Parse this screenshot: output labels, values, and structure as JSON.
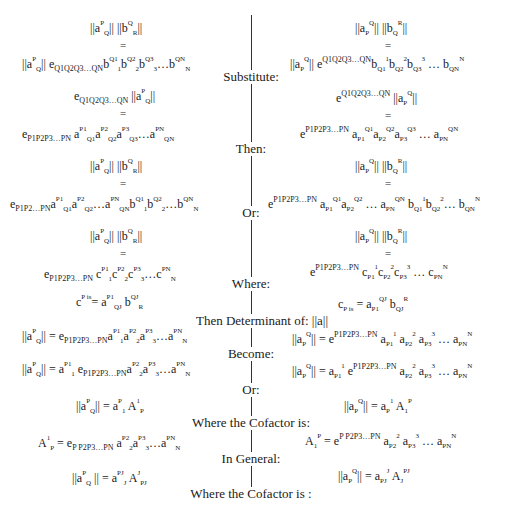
{
  "labels": {
    "substitute": "Substitute:",
    "then": "Then:",
    "or1": "Or:",
    "where": "Where:",
    "determinant": "Then Determinant of: ||a||",
    "become": "Become:",
    "or2": "Or:",
    "cofactor1": "Where the Cofactor is:",
    "general": "In General:",
    "cofactor2": "Where the Cofactor is :"
  },
  "left": {
    "eq1_lhs": "||aPQ|| ||bQR||",
    "eq1_rhs": "||aPQ|| eQ1Q2Q3...QN bQ1 1 bQ2 2 bQ3 3 ... bQN N",
    "eq2_lhs": "eQ1Q2Q3...QN ||aPQ||",
    "eq2_rhs": "eP1P2P3...PN aP1 Q1 aP2 Q2 aP3 Q3 ... aPN QN",
    "eq3_lhs": "||aPQ|| ||bQR||",
    "eq3_rhs": "eP1P2...PN aP1 Q1 aP2 Q2 ... aPN QN bQ1 1 bQ2 2 ... bQN N",
    "eq4_lhs": "||aPQ|| ||bQR||",
    "eq4_rhs": "eP1P2P3...PN cP1 1 cP2 2 cP3 3 ... cPN N",
    "eq5": "cP is = aP1 QJ bQJ R",
    "eq6": "||aPQ|| = eP1P2P3...PN aP1 1 aP2 2 aP3 3 ... aPN N",
    "eq7": "||aPQ|| = aP1 1 eP1P2P3...PN aP2 2 aP3 3 ... aPN N",
    "eq8": "||aPQ|| = aP1 A1P",
    "eq9": "A1P = eP P2P3...PN aP2 2 aP3 3 ... aPN N",
    "eq10": "||aPQ|| = aPJ J AJ PJ"
  },
  "right": {
    "eq1_lhs": "||aPQ|| ||bQR||",
    "eq1_rhs": "||aPQ|| eQ1Q2Q3...QN bQ1 1 bQ2 2 bQ3 3 ... bQN N",
    "eq2_lhs": "eQ1Q2Q3...QN ||aPQ||",
    "eq2_rhs": "eP1P2P3...PN aP1 Q1 aP2 Q2 aP3 Q3 ... aPN QN",
    "eq3_lhs": "||aPQ|| ||bQR||",
    "eq3_rhs": "eP1P2P3...PN aP1 Q1 aP2 Q2 ... aPN QN bQ1 1 bQ2 2 ... bQN N",
    "eq4_lhs": "||aPQ|| ||bQR||",
    "eq4_rhs": "eP1P2P3...PN cP1 1 cP2 2 cP3 3 ... cPN N",
    "eq5": "cP is = aP1 QJ bQJ R",
    "eq6": "||aPQ|| = eP1P2P3...PN aP1 1 aP2 2 aP3 3 ... aPN N",
    "eq7": "||aPQ|| = aP1 1 eP1P2P3...PN aP2 2 aP3 3 ... aPN N",
    "eq8": "||aPQ|| = aP 1 A1P",
    "eq9": "A1P = eP P2P3...PN aP2 2 aP3 3 ... aPN N",
    "eq10": "||aPQ|| = aPJ J AJ PJ"
  },
  "glyphs": {
    "equals": "=",
    "norm": "||",
    "ellipsis": "...",
    "dots": "…"
  }
}
